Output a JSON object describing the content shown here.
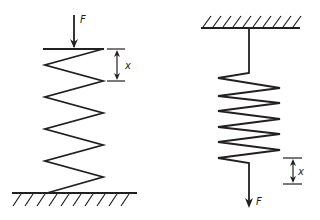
{
  "diagram": {
    "stroke_color": "#231f20",
    "background": "#ffffff",
    "left_spring": {
      "description": "Compression spring on ground, force F pushing down",
      "force_label": "F",
      "displacement_label": "x",
      "support": "ground"
    },
    "right_spring": {
      "description": "Extension spring hung from ceiling, force F pulling down",
      "force_label": "F",
      "displacement_label": "x",
      "support": "ceiling"
    }
  }
}
